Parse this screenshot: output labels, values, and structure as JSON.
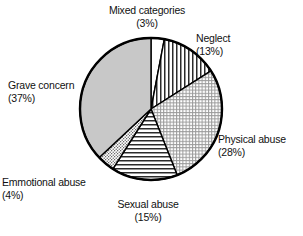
{
  "chart_data": {
    "type": "pie",
    "title": "",
    "subtitle": "",
    "xlabel": "",
    "ylabel": "",
    "legend_position": "none",
    "grid": false,
    "units": "percent",
    "start_angle_deg": 0,
    "direction": "clockwise",
    "categories": [
      "Mixed categories",
      "Neglect",
      "Physical abuse",
      "Sexual abuse",
      "Emmotional abuse",
      "Grave concern"
    ],
    "values": [
      3,
      13,
      28,
      15,
      4,
      37
    ],
    "total": 100,
    "slices": [
      {
        "label": "Mixed categories",
        "value": 3,
        "percent_text": "(3%)",
        "fill": "white",
        "fill_color": "#ffffff"
      },
      {
        "label": "Neglect",
        "value": 13,
        "percent_text": "(13%)",
        "fill": "vertical-lines",
        "fill_color": "#ffffff"
      },
      {
        "label": "Physical abuse",
        "value": 28,
        "percent_text": "(28%)",
        "fill": "crosshatch-grid",
        "fill_color": "#ffffff"
      },
      {
        "label": "Sexual abuse",
        "value": 15,
        "percent_text": "(15%)",
        "fill": "horizontal-lines",
        "fill_color": "#ffffff"
      },
      {
        "label": "Emmotional abuse",
        "value": 4,
        "percent_text": "(4%)",
        "fill": "stipple-dots",
        "fill_color": "#ffffff"
      },
      {
        "label": "Grave concern",
        "value": 37,
        "percent_text": "(37%)",
        "fill": "solid-gray",
        "fill_color": "#c8c8c8"
      }
    ],
    "colors": {
      "outline": "#000000",
      "pattern_ink": "#2b2b2b",
      "grave_concern_gray": "#c8c8c8",
      "background": "#ffffff",
      "text": "#111111"
    }
  },
  "labels": {
    "mixed": {
      "name": "Mixed categories",
      "pct": "(3%)"
    },
    "neglect": {
      "name": "Neglect",
      "pct": "(13%)"
    },
    "physical": {
      "name": "Physical abuse",
      "pct": "(28%)"
    },
    "sexual": {
      "name": "Sexual abuse",
      "pct": "(15%)"
    },
    "emmotional": {
      "name": "Emmotional abuse",
      "pct": "(4%)"
    },
    "grave": {
      "name": "Grave concern",
      "pct": "(37%)"
    }
  }
}
